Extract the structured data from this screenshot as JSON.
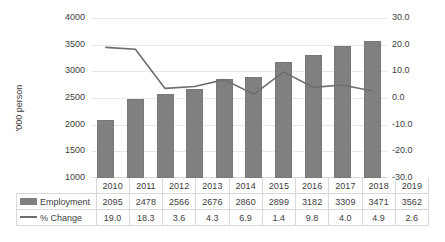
{
  "chart_data": {
    "type": "bar",
    "title": "",
    "xlabel": "",
    "ylabel": "'000 person",
    "y2label": "",
    "categories": [
      "2010",
      "2011",
      "2012",
      "2013",
      "2014",
      "2015",
      "2016",
      "2017",
      "2018",
      "2019"
    ],
    "series": [
      {
        "name": "Employment",
        "type": "bar",
        "axis": "left",
        "color": "#808080",
        "values": [
          2095,
          2478,
          2566,
          2676,
          2860,
          2899,
          3182,
          3309,
          3471,
          3562
        ]
      },
      {
        "name": "% Change",
        "type": "line",
        "axis": "right",
        "color": "#6e6e6e",
        "values": [
          19.0,
          18.3,
          3.6,
          4.3,
          6.9,
          1.4,
          9.8,
          4.0,
          4.9,
          2.6
        ]
      }
    ],
    "ylim": [
      1000,
      4000
    ],
    "yticks": [
      "4000",
      "3500",
      "3000",
      "2500",
      "2000",
      "1500",
      "1000"
    ],
    "y2lim": [
      -30.0,
      30.0
    ],
    "y2ticks": [
      "30.0",
      "20.0",
      "10.0",
      "0.0",
      "-10.0",
      "-20.0",
      "-30.0"
    ],
    "grid": true,
    "legend_position": "data-table"
  },
  "data_table": {
    "header": [
      "",
      "2010",
      "2011",
      "2012",
      "2013",
      "2014",
      "2015",
      "2016",
      "2017",
      "2018",
      "2019"
    ],
    "rows": [
      {
        "label": "Employment",
        "marker": "bar-swatch",
        "values": [
          "2095",
          "2478",
          "2566",
          "2676",
          "2860",
          "2899",
          "3182",
          "3309",
          "3471",
          "3562"
        ]
      },
      {
        "label": "% Change",
        "marker": "line-swatch",
        "values": [
          "19.0",
          "18.3",
          "3.6",
          "4.3",
          "6.9",
          "1.4",
          "9.8",
          "4.0",
          "4.9",
          "2.6"
        ]
      }
    ]
  }
}
